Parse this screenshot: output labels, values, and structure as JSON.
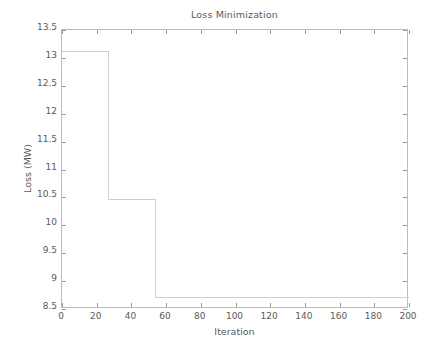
{
  "figure": {
    "title": "Loss Minimization",
    "background": "#ffffff",
    "axis_color": "#bcbcbc",
    "tick_color": "#9a9a9a",
    "text_color": "#5a5a5a",
    "line_color": "#cfcfcf"
  },
  "axes": {
    "x_title": "Iteration",
    "y_title": "Loss (MW)",
    "x_ticks": [
      "0",
      "20",
      "40",
      "60",
      "80",
      "100",
      "120",
      "140",
      "160",
      "180",
      "200"
    ],
    "y_ticks": [
      "8.5",
      "9",
      "9.5",
      "10",
      "10.5",
      "11",
      "11.5",
      "12",
      "12.5",
      "13",
      "13.5"
    ]
  },
  "chart_data": {
    "type": "line",
    "title": "Loss Minimization",
    "xlabel": "Iteration",
    "ylabel": "Loss (MW)",
    "xlim": [
      0,
      200
    ],
    "ylim": [
      8.5,
      13.5
    ],
    "xticks": [
      0,
      20,
      40,
      60,
      80,
      100,
      120,
      140,
      160,
      180,
      200
    ],
    "yticks": [
      8.5,
      9,
      9.5,
      10,
      10.5,
      11,
      11.5,
      12,
      12.5,
      13,
      13.5
    ],
    "grid": false,
    "legend": null,
    "drawstyle": "steps-post",
    "series": [
      {
        "name": "Loss",
        "color": "#cfcfcf",
        "x": [
          0,
          27,
          27,
          54,
          54,
          200
        ],
        "y": [
          13.11,
          13.11,
          10.47,
          10.47,
          8.71,
          8.71
        ]
      }
    ],
    "steps": [
      {
        "from_iteration": 0,
        "to_iteration": 27,
        "loss": 13.11
      },
      {
        "from_iteration": 27,
        "to_iteration": 54,
        "loss": 10.47
      },
      {
        "from_iteration": 54,
        "to_iteration": 200,
        "loss": 8.71
      }
    ]
  }
}
